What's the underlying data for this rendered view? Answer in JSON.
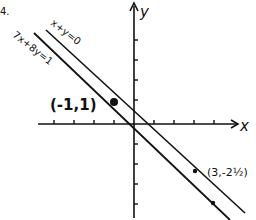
{
  "problem_number": "4.",
  "axes": {
    "x_label": "x",
    "y_label": "y",
    "origin_px": [
      134,
      124
    ],
    "unit_px": 20,
    "x_ticks": [
      -4,
      -3,
      -2,
      -1,
      1,
      2,
      3,
      4
    ],
    "y_ticks": [
      4,
      3,
      2,
      1,
      -1,
      -2,
      -3,
      -4
    ]
  },
  "lines": [
    {
      "name": "x+y=0",
      "label": "x+y=0",
      "equation": "x + y = 0"
    },
    {
      "name": "7x+8y=1",
      "label": "7x+8y=1",
      "equation": "7x + 8y = 1"
    }
  ],
  "points": [
    {
      "label": "(-1,1)",
      "x": -1,
      "y": 1
    },
    {
      "label": "(3,-2½)",
      "x": 3,
      "y": -2.5
    }
  ],
  "colors": {
    "ink": "#111111",
    "background": "#ffffff"
  }
}
